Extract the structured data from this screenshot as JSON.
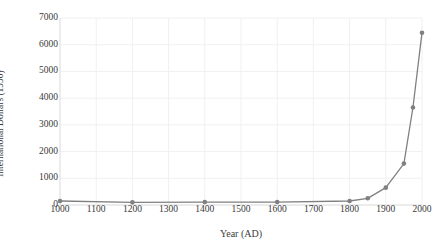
{
  "chart_data": {
    "type": "line",
    "title": "",
    "subtitle": "",
    "xlabel": "Year (AD)",
    "ylabel": "International Dollars (1990)",
    "x": [
      1000,
      1200,
      1400,
      1600,
      1800,
      1850,
      1900,
      1950,
      1975,
      2000
    ],
    "values": [
      150,
      100,
      110,
      110,
      150,
      250,
      650,
      1550,
      3650,
      6450
    ],
    "series": [
      {
        "name": "GDP per capita",
        "values": [
          150,
          100,
          110,
          110,
          150,
          250,
          650,
          1550,
          3650,
          6450
        ]
      }
    ],
    "xlim": [
      1000,
      2000
    ],
    "ylim": [
      0,
      7000
    ],
    "xticks": [
      1000,
      1100,
      1200,
      1300,
      1400,
      1500,
      1600,
      1700,
      1800,
      1900,
      2000
    ],
    "xtick_labels": [
      "1000",
      "1100",
      "1200",
      "1300",
      "1400",
      "1500",
      "1600",
      "1700",
      "1800",
      "1900",
      "2000"
    ],
    "yticks": [
      0,
      1000,
      2000,
      3000,
      4000,
      5000,
      6000,
      7000
    ],
    "ytick_labels": [
      "0",
      "1000",
      "2000",
      "3000",
      "4000",
      "5000",
      "6000",
      "7000"
    ],
    "grid": "both-light",
    "legend": "none",
    "line_color": "#808080",
    "marker_color": "#808080",
    "marker_shape": "circle",
    "axis_color": "#d9d9d9",
    "grid_color": "#f0f0f0",
    "background": "#ffffff"
  }
}
